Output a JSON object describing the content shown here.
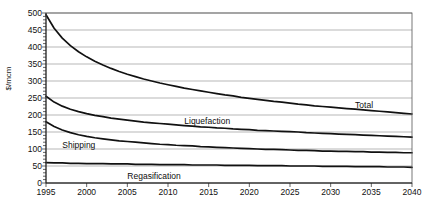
{
  "chart_data": {
    "type": "line",
    "title": "",
    "xlabel": "",
    "ylabel": "$/mcm",
    "xlim": [
      1995,
      2040
    ],
    "ylim": [
      0,
      500
    ],
    "grid": true,
    "legend_position": "inline-annotations",
    "x_ticks": [
      "1995",
      "2000",
      "2005",
      "2010",
      "2015",
      "2020",
      "2025",
      "2030",
      "2035",
      "2040"
    ],
    "y_ticks": [
      "0",
      "50",
      "100",
      "150",
      "200",
      "250",
      "300",
      "350",
      "400",
      "450",
      "500"
    ],
    "x": [
      1995,
      1996,
      1997,
      1998,
      1999,
      2000,
      2001,
      2002,
      2003,
      2004,
      2005,
      2006,
      2007,
      2008,
      2009,
      2010,
      2011,
      2012,
      2013,
      2014,
      2015,
      2016,
      2017,
      2018,
      2019,
      2020,
      2021,
      2022,
      2023,
      2024,
      2025,
      2026,
      2027,
      2028,
      2029,
      2030,
      2031,
      2032,
      2033,
      2034,
      2035,
      2036,
      2037,
      2038,
      2039,
      2040
    ],
    "series": [
      {
        "name": "Total",
        "color": "#111111",
        "label_x": 2033,
        "label_y": 228,
        "values": [
          495,
          455,
          426,
          404,
          386,
          371,
          358,
          347,
          337,
          328,
          320,
          313,
          306,
          300,
          294,
          289,
          284,
          279,
          275,
          271,
          267,
          263,
          259,
          256,
          252,
          249,
          246,
          243,
          240,
          238,
          235,
          232,
          230,
          227,
          225,
          223,
          221,
          219,
          217,
          215,
          213,
          211,
          209,
          207,
          205,
          203
        ]
      },
      {
        "name": "Liquefaction",
        "color": "#111111",
        "label_x": 2012,
        "label_y": 182,
        "values": [
          255,
          238,
          226,
          217,
          210,
          204,
          199,
          195,
          191,
          188,
          185,
          182,
          179,
          177,
          175,
          173,
          171,
          169,
          167,
          165,
          164,
          162,
          161,
          159,
          158,
          157,
          155,
          154,
          153,
          152,
          151,
          150,
          148,
          147,
          146,
          145,
          144,
          143,
          142,
          141,
          140,
          139,
          138,
          137,
          136,
          135
        ]
      },
      {
        "name": "Shipping",
        "color": "#111111",
        "label_x": 1997,
        "label_y": 112,
        "values": [
          180,
          166,
          156,
          148,
          142,
          137,
          133,
          130,
          127,
          124,
          122,
          120,
          118,
          116,
          114,
          113,
          111,
          110,
          109,
          107,
          106,
          105,
          104,
          103,
          102,
          101,
          100,
          99,
          99,
          98,
          97,
          96,
          96,
          95,
          94,
          94,
          93,
          93,
          92,
          92,
          91,
          91,
          90,
          90,
          89,
          89
        ]
      },
      {
        "name": "Regasification",
        "color": "#111111",
        "label_x": 2005,
        "label_y": 22,
        "values": [
          60,
          59,
          59,
          58,
          58,
          57,
          57,
          57,
          56,
          56,
          56,
          55,
          55,
          55,
          54,
          54,
          54,
          54,
          53,
          53,
          53,
          53,
          52,
          52,
          52,
          52,
          51,
          51,
          51,
          51,
          50,
          50,
          50,
          50,
          49,
          49,
          49,
          49,
          48,
          48,
          48,
          48,
          47,
          47,
          47,
          46
        ]
      }
    ]
  },
  "axes": {
    "y_title": "$/mcm"
  }
}
